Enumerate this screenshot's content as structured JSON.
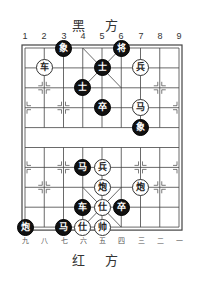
{
  "header": {
    "black_side_label": "黑 方"
  },
  "footer": {
    "red_side_label": "红 方"
  },
  "files_top": [
    "1",
    "2",
    "3",
    "4",
    "5",
    "6",
    "7",
    "8",
    "9"
  ],
  "files_bottom": [
    "九",
    "八",
    "七",
    "六",
    "五",
    "四",
    "三",
    "二",
    "一"
  ],
  "board": {
    "columns": 9,
    "rows": 10,
    "origin_x": 25,
    "origin_y": 48,
    "col_spacing": 19.25,
    "row_spacing": 19.9,
    "line_color": "#444444",
    "black_piece_color": "#111111",
    "red_piece_color": "#ffffff"
  },
  "pieces": [
    {
      "side": "black",
      "char": "象",
      "col": 3,
      "row": 0
    },
    {
      "side": "black",
      "char": "将",
      "col": 6,
      "row": 0
    },
    {
      "side": "red",
      "char": "车",
      "col": 2,
      "row": 1
    },
    {
      "side": "black",
      "char": "士",
      "col": 5,
      "row": 1
    },
    {
      "side": "red",
      "char": "兵",
      "col": 7,
      "row": 1
    },
    {
      "side": "black",
      "char": "士",
      "col": 4,
      "row": 2
    },
    {
      "side": "black",
      "char": "卒",
      "col": 5,
      "row": 3
    },
    {
      "side": "red",
      "char": "马",
      "col": 7,
      "row": 3
    },
    {
      "side": "black",
      "char": "象",
      "col": 7,
      "row": 4
    },
    {
      "side": "black",
      "char": "马",
      "col": 4,
      "row": 6
    },
    {
      "side": "red",
      "char": "兵",
      "col": 5,
      "row": 6
    },
    {
      "side": "red",
      "char": "炮",
      "col": 5,
      "row": 7
    },
    {
      "side": "red",
      "char": "炮",
      "col": 7,
      "row": 7
    },
    {
      "side": "black",
      "char": "车",
      "col": 4,
      "row": 8
    },
    {
      "side": "red",
      "char": "仕",
      "col": 5,
      "row": 8
    },
    {
      "side": "black",
      "char": "卒",
      "col": 6,
      "row": 8
    },
    {
      "side": "black",
      "char": "炮",
      "col": 1,
      "row": 9
    },
    {
      "side": "black",
      "char": "马",
      "col": 3,
      "row": 9
    },
    {
      "side": "red",
      "char": "仕",
      "col": 4,
      "row": 9
    },
    {
      "side": "red",
      "char": "帅",
      "col": 5,
      "row": 9
    }
  ]
}
